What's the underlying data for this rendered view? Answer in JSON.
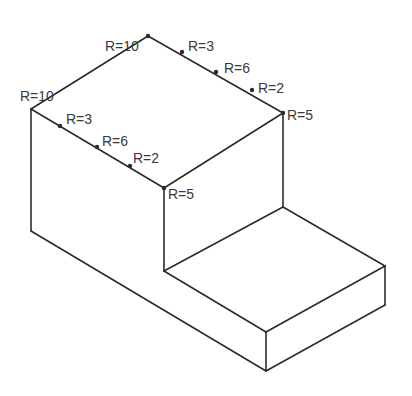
{
  "drawing": {
    "type": "isometric-technical-drawing",
    "title": "L-shaped step block isometric view",
    "background_color": "#ffffff",
    "line_color": "#2b2b2b",
    "text_color": "#3a3a3a",
    "line_width": 1.6,
    "canvas": {
      "width": 412,
      "height": 396
    },
    "vertices": {
      "top_apex": {
        "x": 148,
        "y": 36
      },
      "top_left": {
        "x": 31,
        "y": 109
      },
      "top_right": {
        "x": 283,
        "y": 113
      },
      "notch_top": {
        "x": 164,
        "y": 188
      },
      "left_bottom": {
        "x": 31,
        "y": 231
      },
      "notch_floor_front": {
        "x": 164,
        "y": 271
      },
      "notch_floor_back": {
        "x": 283,
        "y": 207
      },
      "slab_right_top": {
        "x": 385,
        "y": 266
      },
      "slab_right_bottom": {
        "x": 385,
        "y": 305
      },
      "slab_front_bottom": {
        "x": 266,
        "y": 371
      },
      "slab_front_top": {
        "x": 266,
        "y": 332
      }
    },
    "paths": [
      {
        "name": "top-face-upper-left-edge",
        "points": "31,109 148,36"
      },
      {
        "name": "top-face-upper-right-edge",
        "points": "148,36 283,113"
      },
      {
        "name": "top-face-lower-left-edge",
        "points": "31,109 164,188"
      },
      {
        "name": "top-face-lower-right-edge",
        "points": "164,188 283,113"
      },
      {
        "name": "left-vertical-edge",
        "points": "31,109 31,231"
      },
      {
        "name": "notch-vertical-edge",
        "points": "164,188 164,271"
      },
      {
        "name": "right-vertical-edge",
        "points": "283,113 283,207"
      },
      {
        "name": "notch-floor-left-edge",
        "points": "164,271 283,207"
      },
      {
        "name": "notch-floor-right-edge",
        "points": "283,207 385,266"
      },
      {
        "name": "slab-front-top-edge",
        "points": "164,271 266,332"
      },
      {
        "name": "slab-top-right-edge",
        "points": "266,332 385,266"
      },
      {
        "name": "slab-right-vertical-edge",
        "points": "385,266 385,305"
      },
      {
        "name": "slab-front-vertical-edge",
        "points": "266,332 266,371"
      },
      {
        "name": "slab-bottom-right-edge",
        "points": "266,371 385,305"
      },
      {
        "name": "body-front-bottom-edge",
        "points": "31,231 266,371"
      }
    ],
    "tick_marks": [
      {
        "name": "tick-upper-right-r3",
        "x": 182,
        "y": 52
      },
      {
        "name": "tick-upper-right-r6",
        "x": 216,
        "y": 72
      },
      {
        "name": "tick-upper-right-r2",
        "x": 252,
        "y": 90
      },
      {
        "name": "tick-lower-left-r3",
        "x": 60,
        "y": 126
      },
      {
        "name": "tick-lower-left-r6",
        "x": 97,
        "y": 147
      },
      {
        "name": "tick-lower-left-r2",
        "x": 130,
        "y": 166
      },
      {
        "name": "tick-top-apex",
        "x": 148,
        "y": 36
      },
      {
        "name": "tick-top-right-corner",
        "x": 283,
        "y": 113
      },
      {
        "name": "tick-notch-corner",
        "x": 164,
        "y": 188
      }
    ],
    "callouts": [
      {
        "name": "callout-top-apex-r10",
        "label": "R=10",
        "x": 105,
        "y": 51,
        "value": 10
      },
      {
        "name": "callout-upper-right-r3",
        "label": "R=3",
        "x": 188,
        "y": 51,
        "value": 3
      },
      {
        "name": "callout-upper-right-r6",
        "label": "R=6",
        "x": 224,
        "y": 73,
        "value": 6
      },
      {
        "name": "callout-upper-right-r2",
        "label": "R=2",
        "x": 258,
        "y": 93,
        "value": 2
      },
      {
        "name": "callout-top-left-r10",
        "label": "R=10",
        "x": 20,
        "y": 101,
        "value": 10
      },
      {
        "name": "callout-top-right-r5",
        "label": "R=5",
        "x": 287,
        "y": 120,
        "value": 5
      },
      {
        "name": "callout-lower-left-r3",
        "label": "R=3",
        "x": 66,
        "y": 124,
        "value": 3
      },
      {
        "name": "callout-lower-left-r6",
        "label": "R=6",
        "x": 102,
        "y": 146,
        "value": 6
      },
      {
        "name": "callout-lower-left-r2",
        "label": "R=2",
        "x": 133,
        "y": 163,
        "value": 2
      },
      {
        "name": "callout-notch-r5",
        "label": "R=5",
        "x": 168,
        "y": 199,
        "value": 5
      }
    ]
  }
}
